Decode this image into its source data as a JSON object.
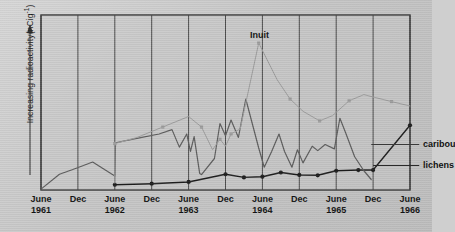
{
  "chart_data": {
    "type": "line",
    "title": "",
    "xlabel": "",
    "ylabel": "Increasing radioactivity(nCig",
    "ylabel_sup": "-1",
    "ylabel_tail": ")",
    "grid": "vertical-only",
    "legend_position": "inline-right",
    "xlim": [
      0,
      10
    ],
    "ylim": [
      0,
      100
    ],
    "xtick_labels": [
      {
        "month": "June",
        "year": "1961"
      },
      {
        "month": "Dec",
        "year": ""
      },
      {
        "month": "June",
        "year": "1962"
      },
      {
        "month": "Dec",
        "year": ""
      },
      {
        "month": "June",
        "year": "1963"
      },
      {
        "month": "Dec",
        "year": ""
      },
      {
        "month": "June",
        "year": "1964"
      },
      {
        "month": "Dec",
        "year": ""
      },
      {
        "month": "June",
        "year": "1965"
      },
      {
        "month": "Dec",
        "year": ""
      },
      {
        "month": "June",
        "year": "1966"
      }
    ],
    "annotations": [
      {
        "name": "inuit-label",
        "text": "Inuit",
        "x": 5.92,
        "y": 88
      },
      {
        "name": "caribou-label",
        "text": "caribou",
        "x": 10.35,
        "y": 26
      },
      {
        "name": "lichens-label",
        "text": "lichens",
        "x": 10.35,
        "y": 14
      }
    ],
    "series": [
      {
        "name": "lichens",
        "color": "#1d1d1d",
        "marker": "circle",
        "width": 1.4,
        "points": [
          [
            2.0,
            3.0
          ],
          [
            3.0,
            3.6
          ],
          [
            4.0,
            4.6
          ],
          [
            5.0,
            9.0
          ],
          [
            5.5,
            7.2
          ],
          [
            6.0,
            7.6
          ],
          [
            6.5,
            10.0
          ],
          [
            7.0,
            8.6
          ],
          [
            7.5,
            8.4
          ],
          [
            8.0,
            11.0
          ],
          [
            8.6,
            11.4
          ],
          [
            9.0,
            11.4
          ],
          [
            10.0,
            37.0
          ]
        ]
      },
      {
        "name": "caribou",
        "color": "#5c5c5c",
        "marker": "none",
        "width": 1.2,
        "points": [
          [
            0.0,
            0.5
          ],
          [
            0.5,
            9.0
          ],
          [
            0.9,
            12.0
          ],
          [
            1.4,
            16.0
          ],
          [
            2.0,
            8.0
          ],
          [
            2.02,
            27.0
          ],
          [
            2.6,
            29.5
          ],
          [
            3.2,
            32.0
          ],
          [
            3.55,
            34.5
          ],
          [
            3.75,
            24.5
          ],
          [
            3.95,
            32.0
          ],
          [
            4.05,
            22.0
          ],
          [
            4.15,
            30.5
          ],
          [
            4.3,
            9.5
          ],
          [
            4.35,
            8.8
          ],
          [
            4.7,
            18.0
          ],
          [
            4.85,
            38.0
          ],
          [
            5.0,
            31.0
          ],
          [
            5.15,
            40.0
          ],
          [
            5.35,
            30.0
          ],
          [
            5.55,
            52.0
          ],
          [
            5.75,
            36.0
          ],
          [
            5.9,
            24.0
          ],
          [
            6.05,
            13.0
          ],
          [
            6.25,
            22.0
          ],
          [
            6.45,
            32.0
          ],
          [
            6.6,
            22.0
          ],
          [
            6.8,
            13.0
          ],
          [
            6.95,
            23.0
          ],
          [
            7.1,
            15.5
          ],
          [
            7.35,
            25.0
          ],
          [
            7.5,
            22.5
          ],
          [
            7.7,
            26.0
          ],
          [
            7.95,
            23.5
          ],
          [
            8.1,
            41.0
          ],
          [
            8.25,
            33.0
          ],
          [
            8.5,
            19.0
          ],
          [
            8.75,
            11.0
          ],
          [
            8.95,
            6.0
          ]
        ]
      },
      {
        "name": "Inuit",
        "color": "#9c9c9c",
        "marker": "square",
        "width": 1.0,
        "points": [
          [
            2.0,
            4.0
          ],
          [
            2.0,
            26.5
          ],
          [
            2.6,
            30.0
          ],
          [
            3.3,
            36.0
          ],
          [
            4.0,
            42.0
          ],
          [
            4.35,
            36.0
          ],
          [
            4.65,
            23.0
          ],
          [
            4.85,
            29.0
          ],
          [
            5.0,
            25.0
          ],
          [
            5.15,
            32.0
          ],
          [
            5.4,
            35.0
          ],
          [
            5.9,
            84.0
          ],
          [
            6.4,
            63.0
          ],
          [
            6.75,
            52.0
          ],
          [
            7.1,
            45.0
          ],
          [
            7.55,
            39.5
          ],
          [
            7.9,
            42.5
          ],
          [
            8.35,
            51.0
          ],
          [
            8.75,
            54.5
          ],
          [
            9.5,
            50.5
          ],
          [
            10.0,
            48.0
          ]
        ]
      }
    ]
  },
  "axes": {
    "y_arrow": true,
    "frame": true
  }
}
